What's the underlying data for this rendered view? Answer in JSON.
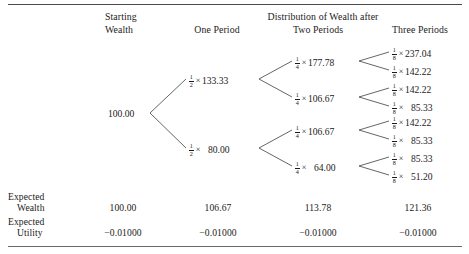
{
  "table": {
    "headers": {
      "col_starting_wealth_line1": "Starting",
      "col_starting_wealth_line2": "Wealth",
      "group_title": "Distribution of Wealth after",
      "col_one_period": "One Period",
      "col_two_periods": "Two Periods",
      "col_three_periods": "Three Periods"
    },
    "root": {
      "value": "100.00"
    },
    "tree": {
      "one_period": [
        {
          "fraction_num": "1",
          "fraction_den": "2",
          "times": "×",
          "value": "133.33"
        },
        {
          "fraction_num": "1",
          "fraction_den": "2",
          "times": "×",
          "value": "80.00"
        }
      ],
      "two_periods": [
        {
          "fraction_num": "1",
          "fraction_den": "4",
          "times": "×",
          "value": "177.78"
        },
        {
          "fraction_num": "1",
          "fraction_den": "4",
          "times": "×",
          "value": "106.67"
        },
        {
          "fraction_num": "1",
          "fraction_den": "4",
          "times": "×",
          "value": "106.67"
        },
        {
          "fraction_num": "1",
          "fraction_den": "4",
          "times": "×",
          "value": "64.00"
        }
      ],
      "three_periods": [
        {
          "fraction_num": "1",
          "fraction_den": "8",
          "times": "×",
          "value": "237.04"
        },
        {
          "fraction_num": "1",
          "fraction_den": "8",
          "times": "×",
          "value": "142.22"
        },
        {
          "fraction_num": "1",
          "fraction_den": "8",
          "times": "×",
          "value": "142.22"
        },
        {
          "fraction_num": "1",
          "fraction_den": "8",
          "times": "×",
          "value": "85.33"
        },
        {
          "fraction_num": "1",
          "fraction_den": "8",
          "times": "×",
          "value": "142.22"
        },
        {
          "fraction_num": "1",
          "fraction_den": "8",
          "times": "×",
          "value": "85.33"
        },
        {
          "fraction_num": "1",
          "fraction_den": "8",
          "times": "×",
          "value": "85.33"
        },
        {
          "fraction_num": "1",
          "fraction_den": "8",
          "times": "×",
          "value": "51.20"
        }
      ]
    },
    "rows": [
      {
        "label_line1": "Expected",
        "label_line2": "Wealth",
        "values": [
          "100.00",
          "106.67",
          "113.78",
          "121.36"
        ]
      },
      {
        "label_line1": "Expected",
        "label_line2": "Utility",
        "values": [
          "−0.01000",
          "−0.01000",
          "−0.01000",
          "−0.01000"
        ]
      }
    ]
  }
}
